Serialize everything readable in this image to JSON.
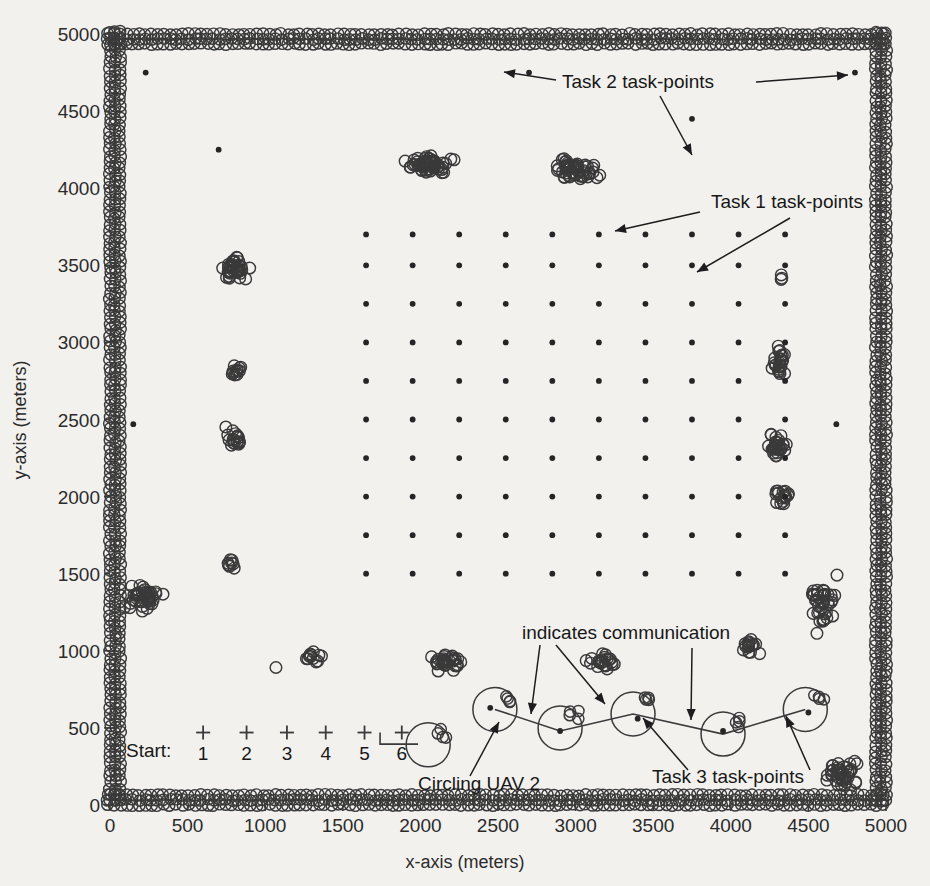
{
  "figure": {
    "background_color": "#f2f1ee",
    "ink_color": "#2b2b2b"
  },
  "axes": {
    "x_title": "x-axis (meters)",
    "y_title": "y-axis (meters)",
    "x_ticks": [
      "0",
      "500",
      "1000",
      "1500",
      "2000",
      "2500",
      "3000",
      "3500",
      "4000",
      "4500",
      "5000"
    ],
    "y_ticks": [
      "0",
      "500",
      "1000",
      "1500",
      "2000",
      "2500",
      "3000",
      "3500",
      "4000",
      "4500",
      "5000"
    ],
    "xlim": [
      0,
      5000
    ],
    "ylim": [
      0,
      5000
    ]
  },
  "annotations": {
    "task2": "Task 2 task-points",
    "task1": "Task 1 task-points",
    "task3": "Task 3 task-points",
    "communication": "indicates communication",
    "circling": "Circling UAV 2",
    "start": "Start:",
    "start_numbers": [
      "1",
      "2",
      "3",
      "4",
      "5",
      "6"
    ]
  },
  "chart_data": {
    "type": "scatter",
    "title": "",
    "xlabel": "x-axis (meters)",
    "ylabel": "y-axis (meters)",
    "xlim": [
      0,
      5000
    ],
    "ylim": [
      0,
      5000
    ],
    "grid": false,
    "legend": "none",
    "series": [
      {
        "name": "Task 1 task-points (regular grid)",
        "marker": "dot",
        "description": "10 x 10 evenly spaced grid of small filled dots",
        "x_values": [
          1650,
          1950,
          2250,
          2550,
          2850,
          3150,
          3450,
          3750,
          4050,
          4350
        ],
        "y_values": [
          1500,
          1750,
          2000,
          2250,
          2500,
          2750,
          3000,
          3250,
          3500,
          3700
        ],
        "count": 100
      },
      {
        "name": "Task 2 task-points (sparse isolated dots)",
        "marker": "dot",
        "points": [
          [
            230,
            4750
          ],
          [
            700,
            4250
          ],
          [
            2700,
            4750
          ],
          [
            3750,
            4450
          ],
          [
            4800,
            4750
          ],
          [
            150,
            2470
          ],
          [
            4680,
            2470
          ]
        ]
      },
      {
        "name": "Task 3 task-points (lower corridor)",
        "marker": "dot",
        "points": [
          [
            3400,
            560
          ],
          [
            2450,
            630
          ],
          [
            2900,
            480
          ],
          [
            3950,
            480
          ],
          [
            4500,
            600
          ]
        ]
      },
      {
        "name": "UAV sensor-footprint circles (boundary patrol)",
        "marker": "open-circle",
        "description": "dense ring of small open circles tracing the 5000x5000 border"
      },
      {
        "name": "UAV sensor-footprint clusters (interior)",
        "marker": "open-circle",
        "clusters": [
          {
            "cx": 800,
            "cy": 3480,
            "n": 40,
            "rx": 130,
            "ry": 130
          },
          {
            "cx": 820,
            "cy": 2820,
            "n": 12,
            "rx": 80,
            "ry": 90
          },
          {
            "cx": 800,
            "cy": 2380,
            "n": 18,
            "rx": 90,
            "ry": 110
          },
          {
            "cx": 790,
            "cy": 1560,
            "n": 8,
            "rx": 60,
            "ry": 70
          },
          {
            "cx": 220,
            "cy": 1350,
            "n": 45,
            "rx": 180,
            "ry": 130
          },
          {
            "cx": 2050,
            "cy": 4150,
            "n": 55,
            "rx": 260,
            "ry": 110
          },
          {
            "cx": 3000,
            "cy": 4120,
            "n": 55,
            "rx": 250,
            "ry": 110
          },
          {
            "cx": 4330,
            "cy": 3420,
            "n": 3,
            "rx": 30,
            "ry": 55
          },
          {
            "cx": 4310,
            "cy": 2880,
            "n": 24,
            "rx": 80,
            "ry": 190
          },
          {
            "cx": 4300,
            "cy": 2320,
            "n": 30,
            "rx": 110,
            "ry": 150
          },
          {
            "cx": 4330,
            "cy": 1990,
            "n": 16,
            "rx": 90,
            "ry": 130
          },
          {
            "cx": 4600,
            "cy": 1300,
            "n": 40,
            "rx": 130,
            "ry": 300
          },
          {
            "cx": 4120,
            "cy": 1030,
            "n": 16,
            "rx": 110,
            "ry": 110
          },
          {
            "cx": 2180,
            "cy": 930,
            "n": 32,
            "rx": 190,
            "ry": 110
          },
          {
            "cx": 3170,
            "cy": 930,
            "n": 22,
            "rx": 170,
            "ry": 80
          },
          {
            "cx": 1320,
            "cy": 960,
            "n": 12,
            "rx": 130,
            "ry": 55
          },
          {
            "cx": 1070,
            "cy": 890,
            "n": 1,
            "rx": 10,
            "ry": 10
          },
          {
            "cx": 4720,
            "cy": 200,
            "n": 40,
            "rx": 220,
            "ry": 180
          }
        ]
      },
      {
        "name": "UAV circling orbits",
        "marker": "large-open-circle",
        "orbits": [
          [
            2050,
            390
          ],
          [
            2480,
            620
          ],
          [
            2900,
            500
          ],
          [
            3370,
            590
          ],
          [
            3950,
            460
          ],
          [
            4480,
            620
          ]
        ]
      },
      {
        "name": "Start markers",
        "marker": "plus",
        "points": [
          [
            600,
            470
          ],
          [
            880,
            470
          ],
          [
            1140,
            470
          ],
          [
            1390,
            470
          ],
          [
            1640,
            470
          ],
          [
            1880,
            470
          ]
        ]
      }
    ]
  }
}
